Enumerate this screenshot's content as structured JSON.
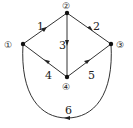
{
  "diagram": {
    "type": "directed-graph",
    "nodes": [
      {
        "id": "1",
        "label": "①",
        "x": 23,
        "y": 44
      },
      {
        "id": "2",
        "label": "②",
        "x": 67,
        "y": 13
      },
      {
        "id": "3",
        "label": "③",
        "x": 111,
        "y": 44
      },
      {
        "id": "4",
        "label": "④",
        "x": 67,
        "y": 77
      }
    ],
    "edges": [
      {
        "id": "1",
        "label": "1",
        "from": "1",
        "to": "2"
      },
      {
        "id": "2",
        "label": "2",
        "from": "2",
        "to": "3"
      },
      {
        "id": "3",
        "label": "3",
        "from": "2",
        "to": "4"
      },
      {
        "id": "4",
        "label": "4",
        "from": "4",
        "to": "1"
      },
      {
        "id": "5",
        "label": "5",
        "from": "4",
        "to": "3"
      },
      {
        "id": "6",
        "label": "6",
        "from": "3",
        "to": "1",
        "curved": true
      }
    ],
    "colors": {
      "line": "#333333",
      "node": "#111111",
      "background": "#ffffff"
    }
  }
}
